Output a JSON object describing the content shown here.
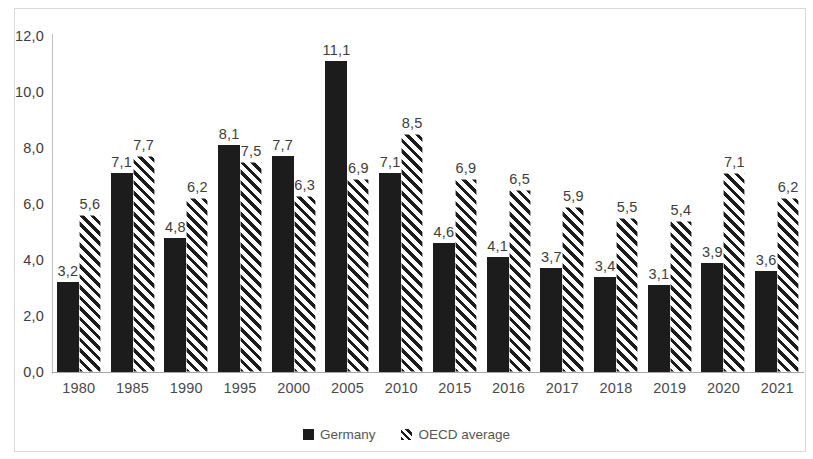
{
  "chart_data": {
    "type": "bar",
    "title": "",
    "subtitle": "",
    "xlabel": "",
    "ylabel": "",
    "ylim": [
      0,
      12
    ],
    "ytick_step": 2,
    "ytick_labels": [
      "0,0",
      "2,0",
      "4,0",
      "6,0",
      "8,0",
      "10,0",
      "12,0"
    ],
    "ytick_values": [
      0,
      2,
      4,
      6,
      8,
      10,
      12
    ],
    "grid": false,
    "legend_position": "bottom-center",
    "decimal_separator": ",",
    "categories": [
      "1980",
      "1985",
      "1990",
      "1995",
      "2000",
      "2005",
      "2010",
      "2015",
      "2016",
      "2017",
      "2018",
      "2019",
      "2020",
      "2021"
    ],
    "series": [
      {
        "name": "Germany",
        "style": "solid",
        "color": "#1c1c1c",
        "values": [
          3.2,
          7.1,
          4.8,
          8.1,
          7.7,
          11.1,
          7.1,
          4.6,
          4.1,
          3.7,
          3.4,
          3.1,
          3.9,
          3.6
        ],
        "labels": [
          "3,2",
          "7,1",
          "4,8",
          "8,1",
          "7,7",
          "11,1",
          "7,1",
          "4,6",
          "4,1",
          "3,7",
          "3,4",
          "3,1",
          "3,9",
          "3,6"
        ]
      },
      {
        "name": "OECD average",
        "style": "hatched-diagonal",
        "color": "#1c1c1c",
        "values": [
          5.6,
          7.7,
          6.2,
          7.5,
          6.3,
          6.9,
          8.5,
          6.9,
          6.5,
          5.9,
          5.5,
          5.4,
          7.1,
          6.2
        ],
        "labels": [
          "5,6",
          "7,7",
          "6,2",
          "7,5",
          "6,3",
          "6,9",
          "8,5",
          "6,9",
          "6,5",
          "5,9",
          "5,5",
          "5,4",
          "7,1",
          "6,2"
        ]
      }
    ]
  },
  "legend": {
    "items": [
      {
        "label": "Germany",
        "swatch": "solid-square-icon"
      },
      {
        "label": "OECD average",
        "swatch": "hatched-square-icon"
      }
    ]
  }
}
